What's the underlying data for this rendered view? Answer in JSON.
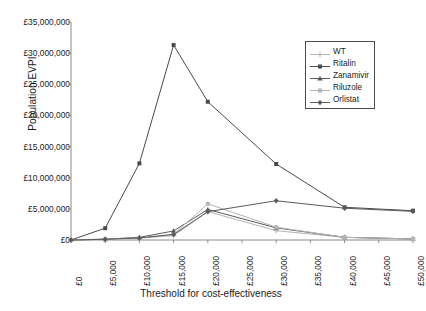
{
  "chart_data": {
    "type": "line",
    "title": "",
    "xlabel": "Threshold for cost-effectiveness",
    "ylabel": "Population EVPI",
    "x": [
      0,
      5000,
      10000,
      15000,
      20000,
      30000,
      40000,
      50000
    ],
    "xtick_labels": [
      "£0",
      "£5,000",
      "£10,000",
      "£15,000",
      "£20,000",
      "£25,000",
      "£30,000",
      "£35,000",
      "£40,000",
      "£45,000",
      "£50,000"
    ],
    "xtick_values": [
      0,
      5000,
      10000,
      15000,
      20000,
      25000,
      30000,
      35000,
      40000,
      45000,
      50000
    ],
    "ytick_labels": [
      "£0",
      "£5,000,000",
      "£10,000,000",
      "£15,000,000",
      "£20,000,000",
      "£25,000,000",
      "£30,000,000",
      "£35,000,000"
    ],
    "ytick_values": [
      0,
      5000000,
      10000000,
      15000000,
      20000000,
      25000000,
      30000000,
      35000000
    ],
    "xlim": [
      0,
      50000
    ],
    "ylim": [
      0,
      35000000
    ],
    "grid": false,
    "legend_position": "top-right",
    "series": [
      {
        "name": "WT",
        "color": "#b4b4b4",
        "marker": "plus",
        "values": [
          0,
          120000,
          300000,
          700000,
          4550000,
          1500000,
          420000,
          180000
        ]
      },
      {
        "name": "Ritalin",
        "color": "#4a4a4a",
        "marker": "square",
        "values": [
          0,
          1900000,
          12300000,
          31300000,
          22200000,
          12200000,
          5250000,
          4700000
        ]
      },
      {
        "name": "Zanamivir",
        "color": "#5a5a5a",
        "marker": "triangle",
        "values": [
          0,
          130000,
          430000,
          1450000,
          4900000,
          1950000,
          430000,
          170000
        ]
      },
      {
        "name": "Riluzole",
        "color": "#b4b4b4",
        "marker": "square-light",
        "values": [
          0,
          120000,
          330000,
          900000,
          5800000,
          2050000,
          430000,
          170000
        ]
      },
      {
        "name": "Orlistat",
        "color": "#5a5a5a",
        "marker": "diamond",
        "values": [
          0,
          120000,
          330000,
          900000,
          4550000,
          6300000,
          5100000,
          4600000
        ]
      }
    ]
  },
  "legend": {
    "entries": [
      "WT",
      "Ritalin",
      "Zanamivir",
      "Riluzole",
      "Orlistat"
    ]
  },
  "axes": {
    "y_title": "Population EVPI",
    "x_title": "Threshold for cost-effectiveness"
  },
  "caption_ghost": ""
}
